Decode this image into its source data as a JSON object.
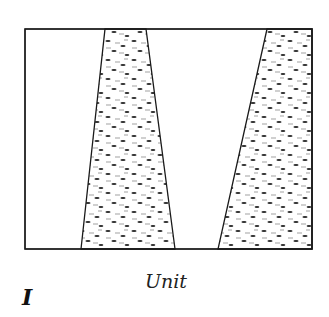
{
  "figure": {
    "panel_label": "I",
    "caption": "Unit",
    "colors": {
      "stroke": "#1a1a1a",
      "fill": "#ffffff",
      "texture": "#2a2a2a",
      "texture_light": "#777777"
    },
    "frame": {
      "x": 25,
      "y": 29,
      "w": 287,
      "h": 220
    },
    "shapes": [
      {
        "name": "left-wedge",
        "points": "105,29 146,29 175,249 81,249"
      },
      {
        "name": "right-wedge",
        "points": "267,29 312,29 312,249 218,249"
      }
    ]
  }
}
